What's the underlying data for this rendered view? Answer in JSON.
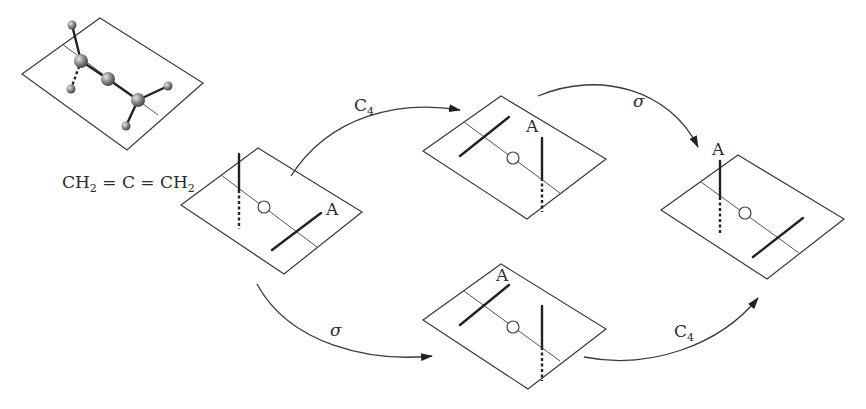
{
  "figure": {
    "formula": {
      "prefix": "CH",
      "sub1": "2",
      "middle": " = C = CH",
      "sub2": "2"
    },
    "marker_label": "A",
    "operations": {
      "c4": {
        "main": "C",
        "sub": "4"
      },
      "sigma": "σ"
    },
    "colors": {
      "line": "#3a3a3a",
      "bond": "#222222",
      "atom_fill": "#8a8a8a",
      "background": "#ffffff"
    },
    "panels": [
      {
        "id": "molecule",
        "label": "3D ball-and-stick allene model"
      },
      {
        "id": "initial",
        "label": "Initial orientation"
      },
      {
        "id": "after-c4",
        "label": "After C4"
      },
      {
        "id": "after-sigma",
        "label": "After sigma"
      },
      {
        "id": "final",
        "label": "Final orientation"
      }
    ],
    "arrows": [
      {
        "from": "initial",
        "to": "after-c4",
        "op": "C4"
      },
      {
        "from": "after-c4",
        "to": "final",
        "op": "sigma"
      },
      {
        "from": "initial",
        "to": "after-sigma",
        "op": "sigma"
      },
      {
        "from": "after-sigma",
        "to": "final",
        "op": "C4"
      }
    ]
  }
}
